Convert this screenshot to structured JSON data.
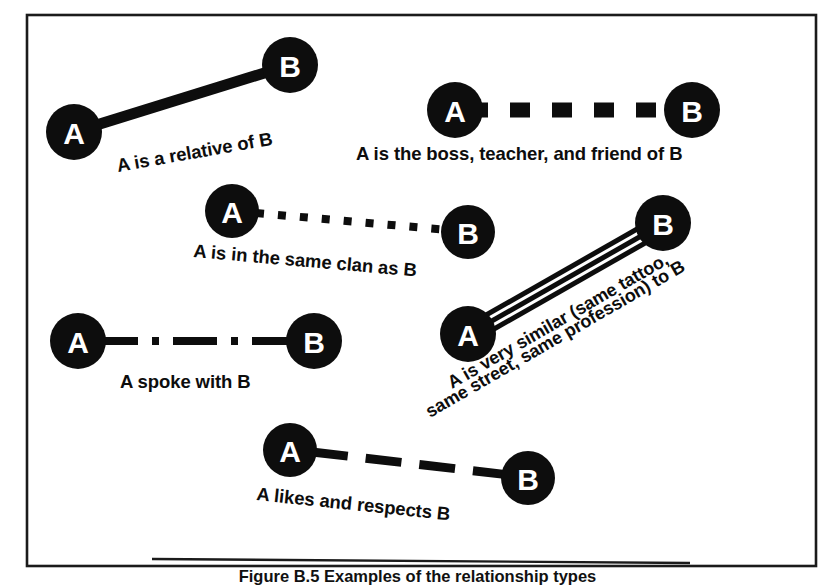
{
  "figure": {
    "caption": "Figure B.5 Examples of the relationship types",
    "frame": {
      "x": 27,
      "y": 15,
      "width": 789,
      "height": 551
    },
    "node_label_a": "A",
    "node_label_b": "B",
    "ink_color": "#0d0d0d",
    "paper_color": "#ffffff",
    "frame_color": "#1b1b1b"
  },
  "relationships": [
    {
      "id": "relative",
      "caption": "A is a relative of B",
      "line_style": "solid",
      "style_name": "thick-solid-line",
      "from": {
        "label": "A",
        "cx": 74,
        "cy": 132,
        "r": 28
      },
      "to": {
        "label": "B",
        "cx": 290,
        "cy": 65,
        "r": 28
      },
      "caption_x": 118,
      "caption_y": 172,
      "caption_rotate": -10
    },
    {
      "id": "boss-teacher-friend",
      "caption": "A is the boss, teacher, and friend of B",
      "line_style": "thick-dashed",
      "style_name": "thick-dashed-line",
      "from": {
        "label": "A",
        "cx": 455,
        "cy": 110,
        "r": 28
      },
      "to": {
        "label": "B",
        "cx": 692,
        "cy": 110,
        "r": 28
      },
      "caption_x": 356,
      "caption_y": 160,
      "caption_rotate": 0
    },
    {
      "id": "same-clan",
      "caption": "A is in the same clan as B",
      "line_style": "dotted",
      "style_name": "dotted-line",
      "from": {
        "label": "A",
        "cx": 232,
        "cy": 211,
        "r": 27
      },
      "to": {
        "label": "B",
        "cx": 468,
        "cy": 232,
        "r": 27
      },
      "caption_x": 193,
      "caption_y": 257,
      "caption_rotate": 5
    },
    {
      "id": "spoke-with",
      "caption": "A spoke with B",
      "line_style": "dash-dot",
      "style_name": "dash-dot-line",
      "from": {
        "label": "A",
        "cx": 78,
        "cy": 341,
        "r": 28
      },
      "to": {
        "label": "B",
        "cx": 314,
        "cy": 341,
        "r": 28
      },
      "caption_x": 120,
      "caption_y": 388,
      "caption_rotate": 0
    },
    {
      "id": "very-similar",
      "caption_line1": "A is very similar (same tattoo,",
      "caption_line2": "same street, same profession) to B",
      "line_style": "triple-parallel",
      "style_name": "triple-parallel-lines",
      "from": {
        "label": "A",
        "cx": 468,
        "cy": 334,
        "r": 28
      },
      "to": {
        "label": "B",
        "cx": 663,
        "cy": 223,
        "r": 28
      },
      "caption_x": 452,
      "caption_y": 389,
      "caption_rotate": -30
    },
    {
      "id": "likes-respects",
      "caption": "A likes and respects B",
      "line_style": "long-dashed",
      "style_name": "long-dashed-line",
      "from": {
        "label": "A",
        "cx": 290,
        "cy": 450,
        "r": 27
      },
      "to": {
        "label": "B",
        "cx": 528,
        "cy": 478,
        "r": 27
      },
      "caption_x": 256,
      "caption_y": 500,
      "caption_rotate": 6
    }
  ]
}
